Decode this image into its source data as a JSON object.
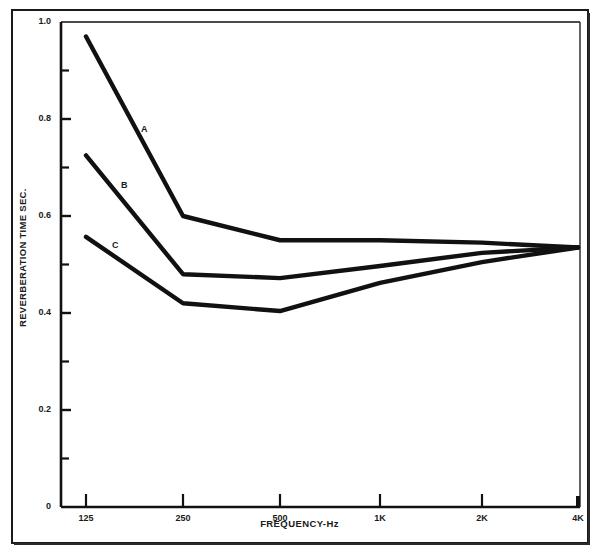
{
  "chart_data": {
    "type": "line",
    "title": "",
    "xlabel": "FREQUENCY-Hz",
    "ylabel": "REVERBERATION TIME SEC.",
    "categories": [
      "125",
      "250",
      "500",
      "1K",
      "2K",
      "4K"
    ],
    "x_tick_labels": [
      "125",
      "250",
      "500",
      "1K",
      "2K",
      "4K"
    ],
    "x_values_hz": [
      125,
      250,
      500,
      1000,
      2000,
      4000
    ],
    "xscale": "log",
    "ylim": [
      0,
      1.0
    ],
    "y_major_ticks": [
      0,
      0.2,
      0.4,
      0.6,
      0.8,
      1.0
    ],
    "y_major_tick_labels": [
      "0",
      "0.2",
      "0.4",
      "0.6",
      "0.8",
      "1.0"
    ],
    "y_minor_ticks": [
      0.1,
      0.3,
      0.5,
      0.7,
      0.9
    ],
    "grid": false,
    "legend": "inline-curve-labels",
    "line_color": "#111111",
    "series": [
      {
        "name": "A",
        "label": "A",
        "values": [
          0.97,
          0.6,
          0.55,
          0.55,
          0.545,
          0.535
        ]
      },
      {
        "name": "B",
        "label": "B",
        "values": [
          0.725,
          0.48,
          0.472,
          0.497,
          0.524,
          0.535
        ]
      },
      {
        "name": "C",
        "label": "C",
        "values": [
          0.557,
          0.42,
          0.404,
          0.462,
          0.505,
          0.535
        ]
      }
    ]
  },
  "axis": {
    "y_title": "REVERBERATION TIME SEC.",
    "x_title": "FREQUENCY-Hz"
  }
}
